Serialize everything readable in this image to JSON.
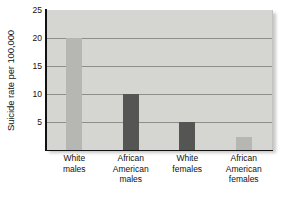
{
  "chart_data": {
    "type": "bar",
    "title": "",
    "xlabel": "",
    "ylabel": "Suicide rate per 100,000",
    "categories": [
      "White\nmales",
      "African\nAmerican\nmales",
      "White\nfemales",
      "African\nAmerican\nfemales"
    ],
    "values": [
      20,
      10,
      5,
      2.3
    ],
    "bar_colors": [
      "#b6b6b2",
      "#555553",
      "#555553",
      "#b6b6b2"
    ],
    "ylim": [
      0,
      25
    ],
    "yticks": [
      5,
      10,
      15,
      20,
      25
    ],
    "ytick_labels": [
      "5",
      "10",
      "15",
      "20",
      "25"
    ],
    "grid": true,
    "grid_axis": "y",
    "legend": "none",
    "plot_background": "#d5d5d1",
    "axis_color": "#111111",
    "gridline_color": "#8d8d89"
  },
  "axes": {
    "y_title": "Suicide rate per 100,000"
  },
  "series_labels": {
    "0": "White males",
    "1": "African American males",
    "2": "White females",
    "3": "African American females"
  }
}
